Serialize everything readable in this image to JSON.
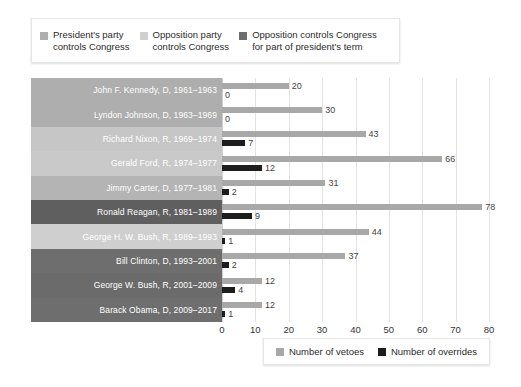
{
  "top_legend": {
    "items": [
      {
        "label": "President's party\ncontrols Congress",
        "color": "#aeaeae",
        "key": "president_party"
      },
      {
        "label": "Opposition party\ncontrols Congress",
        "color": "#cfcfcf",
        "key": "opposition_party"
      },
      {
        "label": "Opposition controls Congress\nfor part of president's term",
        "color": "#6e6e6e",
        "key": "opposition_part"
      }
    ]
  },
  "bottom_legend": {
    "items": [
      {
        "label": "Number of vetoes",
        "color": "#a8a8a8",
        "key": "vetoes"
      },
      {
        "label": "Number of overrides",
        "color": "#1d1d1d",
        "key": "overrides"
      }
    ]
  },
  "chart_data": {
    "type": "bar",
    "orientation": "horizontal",
    "title": "",
    "xlabel": "",
    "ylabel": "",
    "xlim": [
      0,
      80
    ],
    "xticks": [
      "0",
      "10",
      "20",
      "30",
      "40",
      "50",
      "60",
      "70",
      "80"
    ],
    "grid": true,
    "legend_position": "top-left and bottom-right",
    "categories": [
      "John F. Kennedy, D, 1961–1963",
      "Lyndon Johnson, D, 1963–1969",
      "Richard Nixon, R, 1969–1974",
      "Gerald Ford, R, 1974–1977",
      "Jimmy Carter, D, 1977–1981",
      "Ronald Reagan, R, 1981–1989",
      "George H. W. Bush, R, 1989–1993",
      "Bill Clinton, D, 1993–2001",
      "George W. Bush, R, 2001–2009",
      "Barack Obama, D, 2009–2017"
    ],
    "series": [
      {
        "name": "Number of vetoes",
        "color": "#a8a8a8",
        "values": [
          20,
          30,
          43,
          66,
          31,
          78,
          44,
          37,
          12,
          12
        ]
      },
      {
        "name": "Number of overrides",
        "color": "#1d1d1d",
        "values": [
          0,
          0,
          7,
          12,
          2,
          9,
          1,
          2,
          4,
          1
        ]
      }
    ],
    "row_categories": [
      "president_party",
      "president_party",
      "opposition_party",
      "opposition_party",
      "president_party",
      "opposition_part",
      "opposition_party",
      "opposition_part",
      "opposition_part",
      "opposition_part"
    ],
    "row_colors": [
      "#aeaeae",
      "#aeaeae",
      "#c6c6c6",
      "#c9c9c9",
      "#b4b4b4",
      "#5f5f5f",
      "#cfcfcf",
      "#6e6e6e",
      "#6b6b6b",
      "#6e6e6e"
    ]
  }
}
